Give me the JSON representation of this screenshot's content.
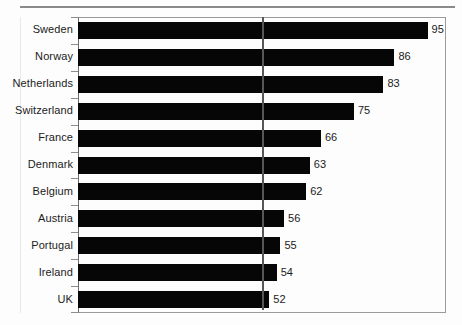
{
  "chart_data": {
    "type": "bar",
    "orientation": "horizontal",
    "title": "",
    "subtitle": "",
    "xlabel": "",
    "ylabel": "",
    "categories": [
      "Sweden",
      "Norway",
      "Netherlands",
      "Switzerland",
      "France",
      "Denmark",
      "Belgium",
      "Austria",
      "Portugal",
      "Ireland",
      "UK"
    ],
    "values": [
      95,
      86,
      83,
      75,
      66,
      63,
      62,
      56,
      55,
      54,
      52
    ],
    "value_labels": [
      "95",
      "86",
      "83",
      "75",
      "66",
      "63",
      "62",
      "56",
      "55",
      "54",
      "52"
    ],
    "xlim": [
      0,
      100
    ],
    "grid": false,
    "legend": null,
    "tick_labels": [],
    "annotations": [
      {
        "name": "reference-line",
        "orientation": "vertical",
        "value": 50
      }
    ],
    "colors": {
      "bar": "#060606",
      "frame": "#9a9a9a",
      "axis": "#6e6e6e",
      "reference_line": "#55585a",
      "text": "#1b1b1b",
      "background": "#fdfdfd",
      "top_rule": "#8a8a8a"
    }
  }
}
